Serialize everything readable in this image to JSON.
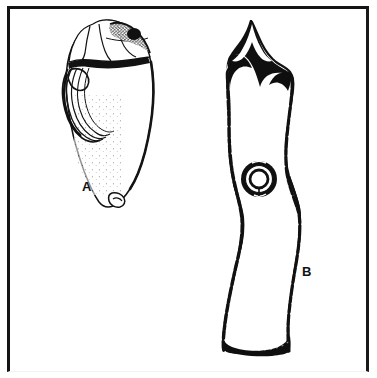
{
  "figure": {
    "kind": "archaeological-artifact-plate",
    "background_color": "#ffffff",
    "ink_color": "#111111",
    "frame": {
      "name": "plate-border",
      "color": "#141414",
      "style": "rectangular rule box"
    },
    "items": [
      {
        "id": "A",
        "label": "A",
        "name": "artifact-a",
        "description": "Flake / blade core fragment drawn in side view; stippled cortex surface, bulb of percussion with concentric ripple rings at upper left, faceted striking platform at top",
        "label_position": {
          "x": 82,
          "y": 180
        },
        "features": [
          "striking-platform",
          "bulb-of-percussion",
          "concentric-ripple-rings",
          "stipple-shading",
          "distal-tip"
        ]
      },
      {
        "id": "B",
        "label": "B",
        "name": "artifact-b",
        "description": "Elongated bifurcate-tanged implement with a central circular perforation; flared barbed head, waisted midsection and chisel-like squared base",
        "label_position": {
          "x": 302,
          "y": 265
        },
        "features": [
          "bifurcate-barbed-head",
          "notched-tangs",
          "central-perforation",
          "stipple-edge-shading",
          "squared-base"
        ]
      }
    ],
    "labels": {
      "a": "A",
      "b": "B"
    }
  }
}
